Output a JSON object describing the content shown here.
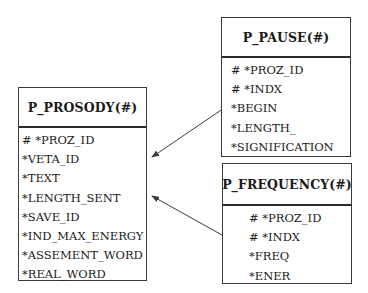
{
  "diagram": {
    "type": "entity-relationship",
    "entities": [
      {
        "id": "p_prosody",
        "title": "P_PROSODY(#)",
        "attributes": [
          "# *PROZ_ID",
          "*VETA_ID",
          "*TEXT",
          "*LENGTH_SENT",
          "*SAVE_ID",
          "*IND_MAX_ENERGY",
          "*ASSEMENT_WORD",
          "*REAL_WORD"
        ]
      },
      {
        "id": "p_pause",
        "title": "P_PAUSE(#)",
        "attributes": [
          "# *PROZ_ID",
          "# *INDX",
          "*BEGIN",
          "*LENGTH_",
          "*SIGNIFICATION"
        ]
      },
      {
        "id": "p_frequency",
        "title": "P_FREQUENCY(#)",
        "attributes": [
          "# *PROZ_ID",
          "# *INDX",
          "*FREQ",
          "*ENER"
        ]
      }
    ],
    "relationships": [
      {
        "from": "P_PAUSE(#)",
        "to": "P_PROSODY(#)",
        "style": "arrow"
      },
      {
        "from": "P_FREQUENCY(#)",
        "to": "P_PROSODY(#)",
        "style": "arrow"
      }
    ],
    "colors": {
      "line": "#3a3a3a",
      "text": "#1a1a1a",
      "background": "#ffffff"
    }
  }
}
